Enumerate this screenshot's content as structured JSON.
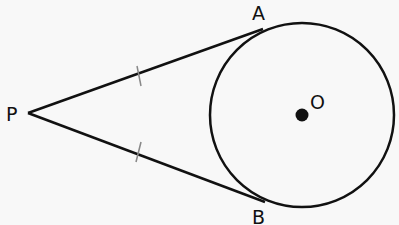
{
  "diagram": {
    "points": {
      "P": {
        "label": "P",
        "x": 28,
        "y": 113
      },
      "A": {
        "label": "A",
        "x": 263,
        "y": 29
      },
      "B": {
        "label": "B",
        "x": 265,
        "y": 202
      },
      "O": {
        "label": "O",
        "x": 302,
        "y": 115
      }
    },
    "circle": {
      "center": "O",
      "radius": 92
    },
    "segments": [
      {
        "from": "P",
        "to": "A",
        "tick_marks": 1
      },
      {
        "from": "P",
        "to": "B",
        "tick_marks": 1
      }
    ],
    "colors": {
      "stroke": "#111111",
      "tick": "#888888",
      "background": "#f8f8f8"
    }
  }
}
